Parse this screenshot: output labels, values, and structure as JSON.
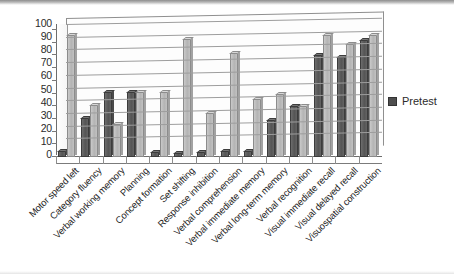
{
  "chart_data": {
    "type": "bar",
    "title": "",
    "subtitle": "",
    "xlabel": "",
    "ylabel": "",
    "ylim": [
      0,
      100
    ],
    "y_ticks": [
      0,
      10,
      20,
      30,
      40,
      50,
      60,
      70,
      80,
      90,
      100
    ],
    "grid": true,
    "legend_position": "right",
    "orientation": "vertical",
    "style": "3d-grayscale-scan",
    "categories": [
      "Motor speed left",
      "Category fluency",
      "Verbal working memory",
      "Planning",
      "Concept formation",
      "Set shifting",
      "Response inhibition",
      "Verbal comprehension",
      "Verbal immediate memory",
      "Verbal long-term memory",
      "Verbal recognition",
      "Visual immediate recall",
      "Visual delayed recall",
      "Visuospatial construction"
    ],
    "series": [
      {
        "name": "Pretest",
        "color": "#555555",
        "values": [
          5,
          31,
          51,
          51,
          4,
          3,
          4,
          5,
          5,
          29,
          40,
          80,
          79,
          92
        ]
      },
      {
        "name": "Posttest",
        "color": "#b4b4b4",
        "values": [
          96,
          41,
          26,
          51,
          51,
          93,
          35,
          82,
          46,
          50,
          40,
          96,
          89,
          96
        ]
      }
    ]
  },
  "legend": {
    "entries": [
      {
        "label": "Pretest",
        "swatch_color": "#4e4e4e"
      }
    ]
  },
  "axes": {
    "y_tick_labels": [
      "100",
      "90",
      "80",
      "70",
      "60",
      "50",
      "40",
      "30",
      "20",
      "10",
      "0"
    ]
  }
}
